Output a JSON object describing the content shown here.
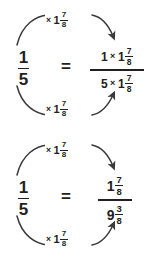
{
  "document": {
    "title": "Equivalent fractions scaling diagram",
    "background_color": "#ffffff",
    "ink_color": "#231f20"
  },
  "symbols": {
    "multiply": "×",
    "equals": "="
  },
  "multiplier": {
    "operator": "×",
    "whole": "1",
    "numerator": "7",
    "denominator": "8"
  },
  "diagrams": [
    {
      "id": "diagram-1",
      "left_fraction": {
        "numerator": "1",
        "denominator": "5"
      },
      "equals": "=",
      "right_fraction": {
        "numerator": {
          "factor": "1",
          "operator": "×",
          "whole": "1",
          "frac_numerator": "7",
          "frac_denominator": "8"
        },
        "denominator": {
          "factor": "5",
          "operator": "×",
          "whole": "1",
          "frac_numerator": "7",
          "frac_denominator": "8"
        }
      },
      "top_arrow_label": {
        "operator": "×",
        "whole": "1",
        "numerator": "7",
        "denominator": "8"
      },
      "bottom_arrow_label": {
        "operator": "×",
        "whole": "1",
        "numerator": "7",
        "denominator": "8"
      }
    },
    {
      "id": "diagram-2",
      "left_fraction": {
        "numerator": "1",
        "denominator": "5"
      },
      "equals": "=",
      "right_fraction": {
        "numerator": {
          "whole": "1",
          "frac_numerator": "7",
          "frac_denominator": "8"
        },
        "denominator": {
          "whole": "9",
          "frac_numerator": "3",
          "frac_denominator": "8"
        }
      },
      "top_arrow_label": {
        "operator": "×",
        "whole": "1",
        "numerator": "7",
        "denominator": "8"
      },
      "bottom_arrow_label": {
        "operator": "×",
        "whole": "1",
        "numerator": "7",
        "denominator": "8"
      }
    }
  ]
}
